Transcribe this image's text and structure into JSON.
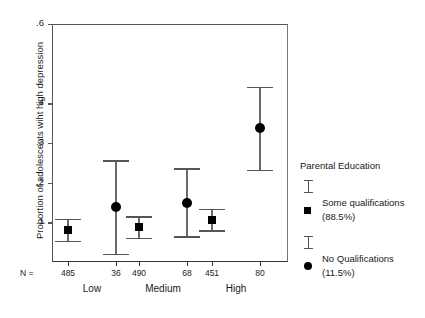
{
  "chart_data": {
    "type": "scatter",
    "title": "",
    "xlabel": "",
    "ylabel": "Proportion of adolescents wiht high depression",
    "ylim": [
      0.0,
      0.6
    ],
    "yticks": [
      0.1,
      0.2,
      0.3,
      0.4,
      0.6
    ],
    "ytick_labels": [
      ".1",
      ".2",
      ".3",
      ".4",
      ".6"
    ],
    "grid": false,
    "legend_position": "right",
    "categories": [
      "Low",
      "Medium",
      "High"
    ],
    "series": [
      {
        "name": "Some qualifications",
        "percent_label": "(88.5%)",
        "marker": "square",
        "color": "#000000",
        "values": [
          0.081,
          0.087,
          0.107
        ],
        "ci_lower": [
          0.053,
          0.06,
          0.08
        ],
        "ci_upper": [
          0.109,
          0.115,
          0.134
        ],
        "n": [
          485,
          490,
          451
        ]
      },
      {
        "name": "No Qualifications",
        "percent_label": "(11.5%)",
        "marker": "circle",
        "color": "#000000",
        "values": [
          0.139,
          0.15,
          0.337
        ],
        "ci_lower": [
          0.02,
          0.065,
          0.232
        ],
        "ci_upper": [
          0.256,
          0.236,
          0.441
        ],
        "n": [
          36,
          68,
          80
        ]
      }
    ]
  },
  "axis": {
    "n_prefix": "N =",
    "n_values": [
      "485",
      "36",
      "490",
      "68",
      "451",
      "80"
    ],
    "group_labels": [
      "Low",
      "Medium",
      "High"
    ]
  },
  "legend": {
    "title": "Parental Education",
    "entries": [
      {
        "label": "Some qualifications",
        "percent": "(88.5%)",
        "marker": "square"
      },
      {
        "label": "No Qualifications",
        "percent": "(11.5%)",
        "marker": "circle"
      }
    ]
  }
}
